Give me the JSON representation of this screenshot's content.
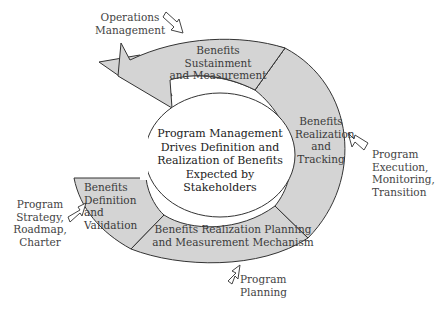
{
  "colors": {
    "segment_fill": "#d4d4d4",
    "stroke": "#333333",
    "text": "#444444",
    "background": "#ffffff"
  },
  "center": {
    "text": "Program Management\nDrives Definition and\nRealization of Benefits\nExpected by Stakeholders"
  },
  "segments": [
    {
      "id": "sustainment",
      "label": "Benefits\nSustainment\nand Measurement"
    },
    {
      "id": "realization",
      "label": "Benefits\nRealization\nand\nTracking"
    },
    {
      "id": "planning",
      "label": "Benefits Realization Planning\nand Measurement Mechanism"
    },
    {
      "id": "definition",
      "label": "Benefits\nDefinition\nand\nValidation"
    }
  ],
  "inputs": [
    {
      "id": "operations",
      "label": "Operations\nManagement",
      "icon": "hollow-arrow-icon"
    },
    {
      "id": "execution",
      "label": "Program\nExecution,\nMonitoring,\nTransition",
      "icon": "hollow-arrow-icon"
    },
    {
      "id": "planning",
      "label": "Program\nPlanning",
      "icon": "hollow-arrow-icon"
    },
    {
      "id": "strategy",
      "label": "Program\nStrategy,\nRoadmap,\nCharter",
      "icon": "hollow-arrow-icon"
    }
  ]
}
